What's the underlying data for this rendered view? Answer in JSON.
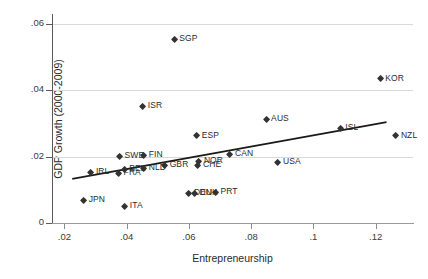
{
  "chart_data": {
    "type": "scatter",
    "title": "",
    "xlabel": "Entrepreneurship",
    "ylabel": "GDP Growth (2000-2009)",
    "xlim": [
      0.016,
      0.132
    ],
    "ylim": [
      0.0,
      0.063
    ],
    "xticks": [
      ".02",
      ".04",
      ".06",
      ".08",
      ".1",
      ".12"
    ],
    "xtick_values": [
      0.02,
      0.04,
      0.06,
      0.08,
      0.1,
      0.12
    ],
    "yticks": [
      "0",
      ".02",
      ".04",
      ".06"
    ],
    "ytick_values": [
      0,
      0.02,
      0.04,
      0.06
    ],
    "grid": "horizontal",
    "legend": "none",
    "marker": "diamond",
    "marker_color": "#333333",
    "grid_color": "#d9d9d9",
    "fit_line": {
      "label": "linear fit",
      "color": "#1a1a1a",
      "x_start": 0.0225,
      "y_start": 0.0133,
      "x_end": 0.1235,
      "y_end": 0.0304
    },
    "points": [
      {
        "label": "SGP",
        "x": 0.0553,
        "y": 0.0552,
        "label_pos": "right"
      },
      {
        "label": "KOR",
        "x": 0.1215,
        "y": 0.0434,
        "label_pos": "right"
      },
      {
        "label": "ISR",
        "x": 0.0452,
        "y": 0.0352,
        "label_pos": "right"
      },
      {
        "label": "AUS",
        "x": 0.0848,
        "y": 0.0313,
        "label_pos": "right"
      },
      {
        "label": "ISL",
        "x": 0.1086,
        "y": 0.0285,
        "label_pos": "right"
      },
      {
        "label": "NZL",
        "x": 0.1265,
        "y": 0.0262,
        "label_pos": "right"
      },
      {
        "label": "ESP",
        "x": 0.0625,
        "y": 0.0262,
        "label_pos": "right"
      },
      {
        "label": "CAN",
        "x": 0.0732,
        "y": 0.0206,
        "label_pos": "right"
      },
      {
        "label": "SWE",
        "x": 0.0377,
        "y": 0.0199,
        "label_pos": "right"
      },
      {
        "label": "FIN",
        "x": 0.0455,
        "y": 0.0203,
        "label_pos": "right"
      },
      {
        "label": "NOR",
        "x": 0.0632,
        "y": 0.0186,
        "label_pos": "right"
      },
      {
        "label": "USA",
        "x": 0.0886,
        "y": 0.0181,
        "label_pos": "right"
      },
      {
        "label": "CHE",
        "x": 0.0629,
        "y": 0.0172,
        "label_pos": "right"
      },
      {
        "label": "GBR",
        "x": 0.0522,
        "y": 0.0174,
        "label_pos": "right"
      },
      {
        "label": "NLD",
        "x": 0.0455,
        "y": 0.0163,
        "label_pos": "right"
      },
      {
        "label": "BEL",
        "x": 0.0392,
        "y": 0.0162,
        "label_pos": "right"
      },
      {
        "label": "FRA",
        "x": 0.0374,
        "y": 0.0149,
        "label_pos": "right"
      },
      {
        "label": "IRL",
        "x": 0.0285,
        "y": 0.0153,
        "label_pos": "right"
      },
      {
        "label": "PRT",
        "x": 0.0685,
        "y": 0.0093,
        "label_pos": "right"
      },
      {
        "label": "DEU",
        "x": 0.06,
        "y": 0.009,
        "label_pos": "right"
      },
      {
        "label": "DNK",
        "x": 0.0618,
        "y": 0.009,
        "label_pos": "right"
      },
      {
        "label": "JPN",
        "x": 0.0262,
        "y": 0.0067,
        "label_pos": "right"
      },
      {
        "label": "ITA",
        "x": 0.0394,
        "y": 0.005,
        "label_pos": "right"
      }
    ]
  }
}
